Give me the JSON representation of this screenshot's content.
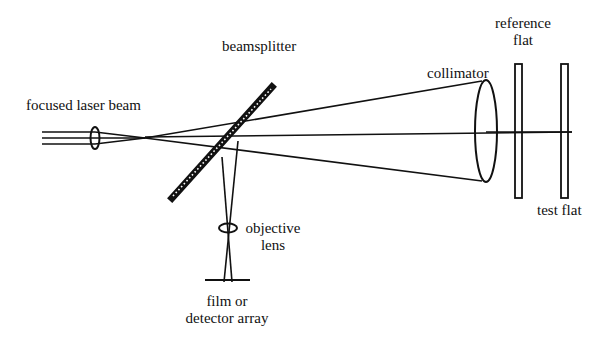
{
  "diagram": {
    "type": "optical-setup",
    "stroke_color": "#111111",
    "background_color": "#ffffff"
  },
  "labels": {
    "focused_laser_beam": "focused laser beam",
    "beamsplitter": "beamsplitter",
    "collimator": "collimator",
    "reference_flat_line1": "reference",
    "reference_flat_line2": "flat",
    "test_flat": "test flat",
    "objective_lens_line1": "objective",
    "objective_lens_line2": "lens",
    "detector_line1": "film or",
    "detector_line2": "detector array"
  },
  "components": [
    {
      "id": "laser-input",
      "name": "focused laser beam",
      "kind": "beam"
    },
    {
      "id": "focusing-lens",
      "name": "focusing lens",
      "kind": "lens"
    },
    {
      "id": "beamsplitter",
      "name": "beamsplitter",
      "kind": "plate"
    },
    {
      "id": "collimator",
      "name": "collimator",
      "kind": "lens"
    },
    {
      "id": "reference-flat",
      "name": "reference flat",
      "kind": "flat"
    },
    {
      "id": "test-flat",
      "name": "test flat",
      "kind": "flat"
    },
    {
      "id": "objective-lens",
      "name": "objective lens",
      "kind": "lens"
    },
    {
      "id": "detector",
      "name": "film or detector array",
      "kind": "detector"
    }
  ]
}
